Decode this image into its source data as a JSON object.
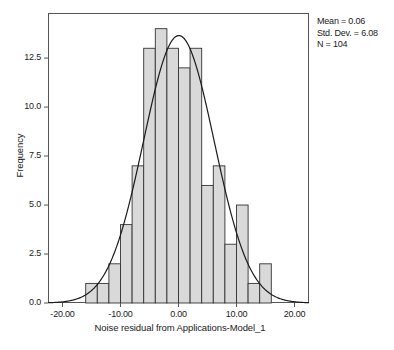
{
  "chart_data": {
    "type": "bar",
    "title": "",
    "subtitle": "",
    "xlabel": "Noise residual from Applications-Model_1",
    "ylabel": "Frequency",
    "xlim": [
      -22.5,
      22.5
    ],
    "ylim": [
      0,
      14.8
    ],
    "grid": false,
    "legend_position": "none",
    "bin_width": 2,
    "bin_starts": [
      -16,
      -14,
      -12,
      -10,
      -8,
      -6,
      -4,
      -2,
      0,
      2,
      4,
      6,
      8,
      10,
      12,
      14
    ],
    "categories": [
      "-16 to -14",
      "-14 to -12",
      "-12 to -10",
      "-10 to -8",
      "-8 to -6",
      "-6 to -4",
      "-4 to -2",
      "-2 to 0",
      "0 to 2",
      "2 to 4",
      "4 to 6",
      "6 to 8",
      "8 to 10",
      "10 to 12",
      "12 to 14",
      "14 to 16"
    ],
    "values": [
      1,
      1,
      2,
      4,
      7,
      13,
      14,
      13,
      12,
      13,
      6,
      7,
      3,
      5,
      1,
      2
    ],
    "xticks": [
      "-20.00",
      "-10.00",
      "0.00",
      "10.00",
      "20.00"
    ],
    "xtick_values": [
      -20,
      -10,
      0,
      10,
      20
    ],
    "yticks": [
      "0.0",
      "2.5",
      "5.0",
      "7.5",
      "10.0",
      "12.5"
    ],
    "ytick_values": [
      0,
      2.5,
      5,
      7.5,
      10,
      12.5
    ],
    "overlay": {
      "type": "normal-curve",
      "mean": 0.06,
      "std_dev": 6.08,
      "n": 104
    },
    "colors": {
      "bar_fill": "#d9d9d9",
      "bar_stroke": "#333333",
      "curve": "#1a1a1a",
      "axis": "#555555",
      "text": "#1a1a1a"
    }
  },
  "annotations": {
    "mean_label": "Mean = 0.06",
    "stddev_label": "Std. Dev. = 6.08",
    "n_label": "N = 104"
  },
  "axes": {
    "x_title": "Noise residual from Applications-Model_1",
    "y_title": "Frequency"
  }
}
